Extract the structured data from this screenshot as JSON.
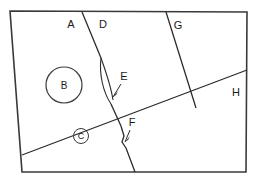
{
  "diagram": {
    "background_color": "#ffffff",
    "line_color": "#2b2b2b",
    "frame_color": "#3a3a3a",
    "text_color": "#1a1a1a",
    "frame": {
      "name": "outer-quadrilateral",
      "points": "10,11 247,12 246,172 22,172"
    },
    "regions": [
      {
        "id": "A",
        "label": "A",
        "label_x": 71,
        "label_y": 28,
        "kind": "region"
      },
      {
        "id": "D",
        "label": "D",
        "label_x": 103,
        "label_y": 28,
        "kind": "region"
      },
      {
        "id": "G",
        "label": "G",
        "label_x": 178,
        "label_y": 29,
        "kind": "region"
      },
      {
        "id": "H",
        "label": "H",
        "label_x": 236,
        "label_y": 96,
        "kind": "region"
      }
    ],
    "boundaries": [
      {
        "id": "A-D-upper",
        "name": "boundary-a-d-upper",
        "path": "M 82,12 L 101,58"
      },
      {
        "id": "A-D-lens-left",
        "name": "boundary-a-d-lens-left",
        "path": "M 101,58 C 99,74 103,92 111,104"
      },
      {
        "id": "A-D-lens-right",
        "name": "boundary-a-d-lens-right",
        "path": "M 101,58 C 106,72 111,86 113,100"
      },
      {
        "id": "A-D-mid",
        "name": "boundary-a-d-mid",
        "path": "M 111,104 L 121,126"
      },
      {
        "id": "A-D-kink",
        "name": "boundary-a-d-kink",
        "path": "M 121,126 L 124,136 L 122,142 L 126,148"
      },
      {
        "id": "A-D-lower",
        "name": "boundary-a-d-lower",
        "path": "M 126,148 L 135,172"
      },
      {
        "id": "D-G",
        "name": "boundary-d-g",
        "path": "M 166,12 L 196,108"
      },
      {
        "id": "H-line",
        "name": "boundary-h",
        "path": "M 22,155 L 247,70"
      }
    ],
    "annotations": [
      {
        "id": "B",
        "name": "circle-label-b",
        "label": "B",
        "shape": "circle",
        "cx": 64,
        "cy": 85,
        "r": 18,
        "text_x": 64,
        "text_y": 89
      },
      {
        "id": "C",
        "name": "circle-label-c",
        "label": "C",
        "shape": "circle",
        "cx": 81,
        "cy": 136,
        "r": 7.5,
        "text_x": 81,
        "text_y": 139
      }
    ],
    "callouts": [
      {
        "id": "E",
        "name": "callout-e",
        "label": "E",
        "label_x": 124,
        "label_y": 80,
        "leader_path": "M 121,84 L 113,97",
        "arrow_points": "113,97 118,91 116,95"
      },
      {
        "id": "F",
        "name": "callout-f",
        "label": "F",
        "label_x": 132,
        "label_y": 126,
        "leader_path": "M 130,130 L 125,142",
        "arrow_points": "125,142 130,136 128,140"
      }
    ]
  }
}
